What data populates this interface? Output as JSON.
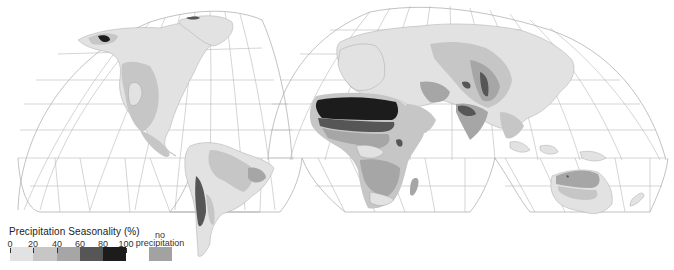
{
  "map": {
    "projection": "interrupted homolosine",
    "variable": "Precipitation Seasonality"
  },
  "legend": {
    "title": "Precipitation Seasonality (%)",
    "ticks": [
      "0",
      "20",
      "40",
      "60",
      "80",
      "100"
    ],
    "classes": [
      {
        "range": "0-20",
        "color": "#e2e2e2"
      },
      {
        "range": "20-40",
        "color": "#c6c6c6"
      },
      {
        "range": "40-60",
        "color": "#a6a6a6"
      },
      {
        "range": "60-80",
        "color": "#565656"
      },
      {
        "range": "80-100",
        "color": "#1c1c1c"
      }
    ],
    "no_precipitation": {
      "label_line1": "no",
      "label_line2": "precipitation",
      "color": "#a2a2a2"
    }
  }
}
